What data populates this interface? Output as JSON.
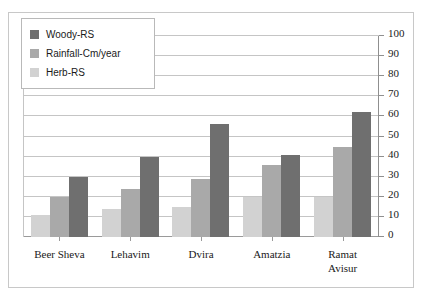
{
  "chart_data": {
    "type": "bar",
    "title": "",
    "subtitle": "",
    "xlabel": "",
    "ylabel": "",
    "ylim": [
      0,
      100
    ],
    "yticks": [
      0,
      10,
      20,
      30,
      40,
      50,
      60,
      70,
      80,
      90,
      100
    ],
    "grid": true,
    "legend_position": "top-left",
    "y_axis_side": "right",
    "categories": [
      "Beer Sheva",
      "Lehavim",
      "Dvira",
      "Amatzia",
      "Ramat Avisur"
    ],
    "category_lines": [
      [
        "Beer Sheva"
      ],
      [
        "Lehavim"
      ],
      [
        "Dvira"
      ],
      [
        "Amatzia"
      ],
      [
        "Ramat",
        "Avisur"
      ]
    ],
    "series": [
      {
        "name": "Herb-RS",
        "color": "#d2d2d2",
        "values": [
          11,
          14,
          15,
          20,
          20
        ]
      },
      {
        "name": "Rainfall-Cm/year",
        "color": "#a9a9a9",
        "values": [
          20,
          24,
          29,
          36,
          45
        ]
      },
      {
        "name": "Woody-RS",
        "color": "#6f6f6f",
        "values": [
          30,
          40,
          56,
          41,
          62
        ]
      }
    ],
    "legend_order": [
      "Woody-RS",
      "Rainfall-Cm/year",
      "Herb-RS"
    ]
  },
  "legend": {
    "items": [
      {
        "label": "Woody-RS",
        "color": "#6f6f6f"
      },
      {
        "label": "Rainfall-Cm/year",
        "color": "#a9a9a9"
      },
      {
        "label": "Herb-RS",
        "color": "#d2d2d2"
      }
    ]
  },
  "colors": {
    "woody": "#6f6f6f",
    "rainfall": "#a9a9a9",
    "herb": "#d2d2d2",
    "gridline": "#c5c5c5",
    "frame": "#c8c8c8",
    "axis": "#8f8f8f"
  }
}
